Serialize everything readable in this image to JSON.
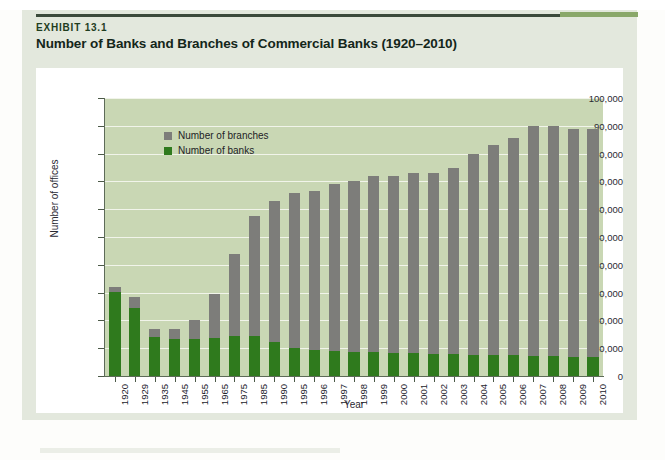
{
  "exhibit": {
    "label": "EXHIBIT 13.1",
    "title": "Number of Banks and Branches of Commercial Banks (1920–2010)"
  },
  "legend": {
    "branches_label": "Number of branches",
    "banks_label": "Number of banks",
    "branches_color": "#7d7d7a",
    "banks_color": "#2f7a1d"
  },
  "axes": {
    "y_title": "Number of offices",
    "x_title": "Year",
    "y_ticks": [
      "0",
      "10,000",
      "20,000",
      "30,000",
      "40,000",
      "50,000",
      "60,000",
      "70,000",
      "80,000",
      "90,000",
      "100,000"
    ]
  },
  "colors": {
    "plot_background": "#c9d7b4",
    "panel_background": "#e3e8dd",
    "gridline": "#f1f4ea",
    "axis": "#5d6b58",
    "rule": "#3b4a3b",
    "rule_accent": "#8aa86a"
  },
  "chart_data": {
    "type": "bar",
    "title": "Number of Banks and Branches of Commercial Banks (1920–2010)",
    "xlabel": "Year",
    "ylabel": "Number of offices",
    "ylim": [
      0,
      100000
    ],
    "ytick_step": 10000,
    "grid": true,
    "stacked": true,
    "legend_position": "top-left-inside",
    "categories": [
      "1920",
      "1929",
      "1935",
      "1945",
      "1955",
      "1965",
      "1975",
      "1985",
      "1990",
      "1995",
      "1996",
      "1997",
      "1998",
      "1999",
      "2000",
      "2001",
      "2002",
      "2003",
      "2004",
      "2005",
      "2006",
      "2007",
      "2008",
      "2009",
      "2010"
    ],
    "series": [
      {
        "name": "Number of banks",
        "color": "#2f7a1d",
        "values": [
          30300,
          24600,
          14100,
          13300,
          13200,
          13500,
          14400,
          14400,
          12300,
          9900,
          9500,
          9100,
          8700,
          8500,
          8300,
          8100,
          7900,
          7800,
          7600,
          7500,
          7400,
          7300,
          7100,
          6900,
          6700
        ]
      },
      {
        "name": "Number of branches",
        "color": "#7d7d7a",
        "values": [
          1700,
          3800,
          2900,
          3700,
          6800,
          16000,
          29600,
          43100,
          50700,
          56100,
          57000,
          59900,
          61300,
          63500,
          63700,
          64900,
          65100,
          67200,
          72400,
          75600,
          78100,
          82700,
          83000,
          82100,
          82300
        ]
      }
    ],
    "totals": [
      32000,
      28400,
      17000,
      17000,
      20000,
      29500,
      44000,
      57500,
      63000,
      66000,
      66500,
      69000,
      70000,
      72000,
      72000,
      73000,
      73000,
      75000,
      80000,
      83100,
      85500,
      90000,
      90100,
      89000,
      89000
    ]
  }
}
